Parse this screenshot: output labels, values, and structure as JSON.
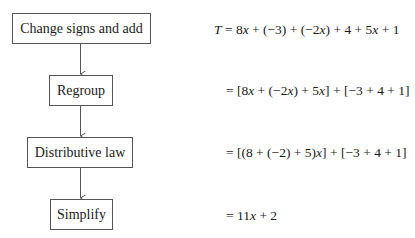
{
  "flowchart": {
    "steps": [
      {
        "label": "Change signs and add"
      },
      {
        "label": "Regroup"
      },
      {
        "label": "Distributive law"
      },
      {
        "label": "Simplify"
      }
    ]
  },
  "equations": [
    {
      "text": "T = 8x + (−3) + (−2x) + 4 + 5x + 1"
    },
    {
      "text": "= [8x + (−2x) + 5x] + [−3 + 4 + 1]"
    },
    {
      "text": "= [(8 + (−2) + 5)x] + [−3 + 4 + 1]"
    },
    {
      "text": "= 11x + 2"
    }
  ],
  "colors": {
    "border": "#555555",
    "text": "#1a1a1a",
    "background": "#ffffff"
  }
}
